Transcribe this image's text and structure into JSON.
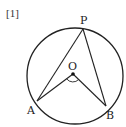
{
  "problem_number": "[1]",
  "diagram": {
    "type": "circle-inscribed-angle",
    "circle": {
      "cx": 75,
      "cy": 76,
      "r": 48
    },
    "points": {
      "P": {
        "label": "P",
        "x": 83,
        "y": 29
      },
      "A": {
        "label": "A",
        "x": 37,
        "y": 101
      },
      "B": {
        "label": "B",
        "x": 106,
        "y": 106
      },
      "O": {
        "label": "O",
        "x": 73,
        "y": 74
      }
    },
    "segments": [
      [
        "P",
        "A"
      ],
      [
        "P",
        "B"
      ],
      [
        "O",
        "A"
      ],
      [
        "O",
        "B"
      ]
    ],
    "angle_marker": {
      "at": "O",
      "between": [
        "A",
        "B"
      ]
    },
    "stroke_color": "#222222"
  }
}
